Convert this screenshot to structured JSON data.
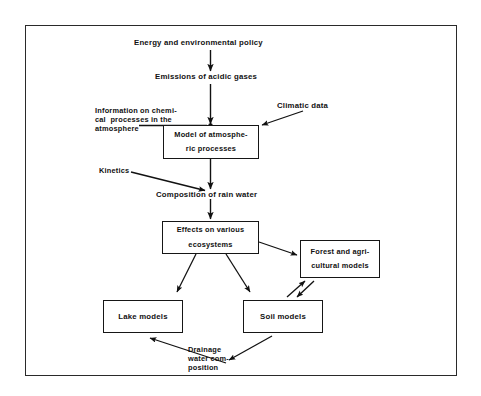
{
  "diagram": {
    "border_color": "#2a2a2a",
    "text_color": "#111111",
    "background": "#ffffff",
    "nodes": {
      "energy_policy": "Energy and environmental policy",
      "emissions": "Emissions of acidic gases",
      "information_line1": "Information on chemi-",
      "information_line2": "cal  processes in the",
      "information_line3": "atmosphere",
      "climatic_data": "Climatic data",
      "atmos_model_line1": "Model of atmosphe-",
      "atmos_model_line2": "ric processes",
      "kinetics": "Kinetics",
      "rain_composition": "Composition of rain water",
      "effects_line1": "Effects on various",
      "effects_line2": "ecosystems",
      "forest_line1": "Forest and agri-",
      "forest_line2": "cultural models",
      "lake_models": "Lake models",
      "soil_models": "Soil models",
      "drainage_line1": "Drainage",
      "drainage_line2": "water com-",
      "drainage_line3": "position"
    }
  }
}
